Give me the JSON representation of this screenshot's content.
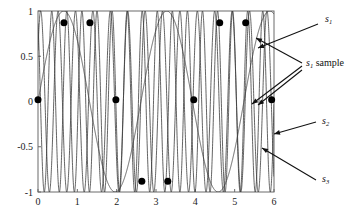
{
  "chart_data": {
    "type": "line",
    "title": "",
    "xlabel": "",
    "ylabel": "",
    "xlim": [
      0,
      6
    ],
    "ylim": [
      -1,
      1
    ],
    "grid": false,
    "legend_position": "right-annotations",
    "x_ticks": [
      "0",
      "1",
      "2",
      "3",
      "4",
      "5",
      "6"
    ],
    "x_tick_values": [
      0,
      1,
      2,
      3,
      4,
      5,
      6
    ],
    "y_ticks": [
      "1",
      "0.5",
      "0",
      "-0.5",
      "-1"
    ],
    "y_tick_values": [
      1,
      0.5,
      0,
      -0.5,
      -1
    ],
    "line_color": "#3c3c3c",
    "marker_color": "#000000",
    "series": [
      {
        "name": "s1",
        "label": "s",
        "subscript": "1",
        "kind": "sine",
        "amplitude": 1.0,
        "angular_frequency": 2.4,
        "phase": 0.0,
        "description": "slow sinusoid, about 2.3 cycles across x 0 to 6"
      },
      {
        "name": "s2",
        "label": "s",
        "subscript": "2",
        "kind": "sine",
        "amplitude": 1.0,
        "angular_frequency": 14.2,
        "phase": 0.6,
        "description": "high frequency sinusoid, about 13.5 cycles across x 0 to 6"
      },
      {
        "name": "s3",
        "label": "s",
        "subscript": "3",
        "kind": "sine",
        "amplitude": 1.0,
        "angular_frequency": 16.4,
        "phase": 2.1,
        "description": "high frequency sinusoid, about 15.5 cycles across x 0 to 6"
      }
    ],
    "samples": {
      "name": "s1 sample",
      "label": "s",
      "subscript": "1",
      "suffix": " sample",
      "marker": "filled-circle",
      "marker_size": 7,
      "x": [
        0.0,
        0.66,
        1.32,
        1.98,
        2.64,
        3.3,
        3.96,
        4.62,
        5.28,
        5.94
      ],
      "y": [
        0.02,
        0.87,
        0.87,
        0.02,
        -0.88,
        -0.88,
        0.02,
        0.87,
        0.87,
        0.02
      ]
    },
    "annotations": [
      {
        "name": "s1",
        "label": "s",
        "subscript": "1",
        "text_x": 325,
        "text_y": 22,
        "arrow_to_x": 258,
        "arrow_to_y": 48
      },
      {
        "name": "s1-sample",
        "label": "s",
        "subscript": "1",
        "suffix": " sample",
        "text_x": 306,
        "text_y": 66,
        "arrow_to_x": 252,
        "arrow_to_y": 104
      },
      {
        "name": "s2",
        "label": "s",
        "subscript": "2",
        "text_x": 322,
        "text_y": 124,
        "arrow_to_x": 274,
        "arrow_to_y": 134
      },
      {
        "name": "s3",
        "label": "s",
        "subscript": "3",
        "text_x": 322,
        "text_y": 182,
        "arrow_to_x": 262,
        "arrow_to_y": 148
      }
    ]
  },
  "plot_box": {
    "left": 38,
    "top": 11,
    "right": 274,
    "bottom": 192
  }
}
